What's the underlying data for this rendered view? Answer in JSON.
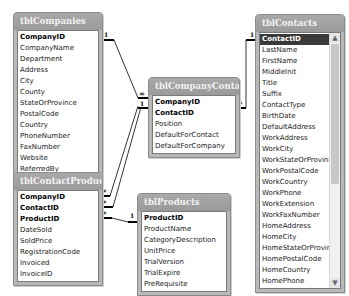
{
  "tables": {
    "companies": {
      "title": "tblCompanies",
      "fields": [
        "CompanyID",
        "CompanyName",
        "Department",
        "Address",
        "City",
        "County",
        "StateOrProvince",
        "PostalCode",
        "Country",
        "PhoneNumber",
        "FaxNumber",
        "Website",
        "ReferredBy"
      ],
      "primary_keys": [
        "CompanyID"
      ]
    },
    "contacts": {
      "title": "tblContacts",
      "fields": [
        "ContactID",
        "LastName",
        "FirstName",
        "MiddleInit",
        "Title",
        "Suffix",
        "ContactType",
        "BirthDate",
        "DefaultAddress",
        "WorkAddress",
        "WorkCity",
        "WorkStateOrProvince",
        "WorkPostalCode",
        "WorkCountry",
        "WorkPhone",
        "WorkExtension",
        "WorkFaxNumber",
        "HomeAddress",
        "HomeCity",
        "HomeStateOrProvince",
        "HomePostalCode",
        "HomeCountry",
        "HomePhone"
      ],
      "primary_keys": [
        "ContactID"
      ],
      "selected_field": "ContactID",
      "scrollbar": {
        "up_icon": "▲",
        "down_icon": "▼"
      }
    },
    "company_contacts": {
      "title": "tblCompanyContacts",
      "fields": [
        "CompanyID",
        "ContactID",
        "Position",
        "DefaultForContact",
        "DefaultForCompany"
      ],
      "primary_keys": [
        "CompanyID",
        "ContactID"
      ]
    },
    "contact_products": {
      "title": "tblContactProducts",
      "fields": [
        "CompanyID",
        "ContactID",
        "ProductID",
        "DateSold",
        "SoldPrice",
        "RegistrationCode",
        "Invoiced",
        "InvoiceID"
      ],
      "primary_keys": [
        "CompanyID",
        "ContactID",
        "ProductID"
      ]
    },
    "products": {
      "title": "tblProducts",
      "fields": [
        "ProductID",
        "ProductName",
        "CategoryDescription",
        "UnitPrice",
        "TrialVersion",
        "TrialExpire",
        "PreRequisite"
      ],
      "primary_keys": [
        "ProductID"
      ]
    }
  },
  "relationships": [
    {
      "from": "tblCompanies.CompanyID",
      "to": "tblCompanyContacts.CompanyID",
      "one": "1",
      "many": "∞"
    },
    {
      "from": "tblContacts.ContactID",
      "to": "tblCompanyContacts.ContactID",
      "one": "1",
      "many": "∞"
    },
    {
      "from": "tblCompanyContacts.CompanyID",
      "to": "tblContactProducts.CompanyID",
      "one": "1",
      "many": "∞"
    },
    {
      "from": "tblCompanyContacts.ContactID",
      "to": "tblContactProducts.ContactID",
      "one": "1",
      "many": "∞"
    },
    {
      "from": "tblProducts.ProductID",
      "to": "tblContactProducts.ProductID",
      "one": "1",
      "many": "∞"
    }
  ],
  "labels": {
    "one": "1",
    "many": "∞"
  }
}
